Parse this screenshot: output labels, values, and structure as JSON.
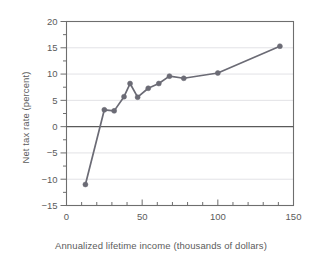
{
  "chart_data": {
    "type": "line",
    "title": "",
    "xlabel": "Annualized lifetime income (thousands of dollars)",
    "ylabel": "Net tax rate (percent)",
    "xlim": [
      0,
      150
    ],
    "ylim": [
      -15,
      20
    ],
    "xticks": [
      0,
      50,
      100,
      150
    ],
    "xtick_labels": [
      "0",
      "50",
      "100",
      "150"
    ],
    "x_minor_tick_step": 10,
    "yticks": [
      -15,
      -10,
      -5,
      0,
      5,
      10,
      15,
      20
    ],
    "ytick_labels": [
      "-15",
      "-10",
      "-5",
      "0",
      "5",
      "10",
      "15",
      "20"
    ],
    "y_minor_tick_step": 2.5,
    "grid": "horizontal-major",
    "legend": "none",
    "zero_line": 0,
    "marker": "filled-circle",
    "series": [
      {
        "name": "Net tax rate",
        "color": "#6b6b75",
        "points": [
          {
            "x": 12.5,
            "y": -11.0
          },
          {
            "x": 25.0,
            "y": 3.2
          },
          {
            "x": 31.5,
            "y": 3.0
          },
          {
            "x": 38.0,
            "y": 5.7
          },
          {
            "x": 42.0,
            "y": 8.2
          },
          {
            "x": 47.0,
            "y": 5.6
          },
          {
            "x": 54.0,
            "y": 7.3
          },
          {
            "x": 61.0,
            "y": 8.2
          },
          {
            "x": 68.0,
            "y": 9.6
          },
          {
            "x": 77.5,
            "y": 9.2
          },
          {
            "x": 100.0,
            "y": 10.2
          },
          {
            "x": 141.0,
            "y": 15.3
          }
        ]
      }
    ]
  },
  "colors": {
    "line": "#6b6b75",
    "marker": "#6b6b75",
    "frame": "#6e6e6e",
    "grid": "#e2e2e6",
    "zero_line": "#5a5a5a",
    "text": "#5b5b5b",
    "background": "#ffffff"
  }
}
